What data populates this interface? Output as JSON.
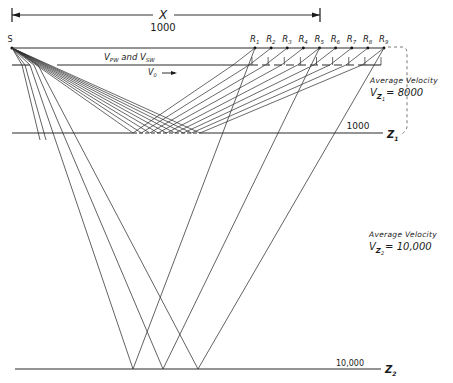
{
  "diagram": {
    "dimension": {
      "symbol": "X",
      "value": "1000"
    },
    "source_label": "S",
    "receivers": [
      "R1",
      "R2",
      "R3",
      "R4",
      "R5",
      "R6",
      "R7",
      "R8",
      "R9"
    ],
    "receiver_labels": [
      {
        "base": "R",
        "sub": "1"
      },
      {
        "base": "R",
        "sub": "2"
      },
      {
        "base": "R",
        "sub": "3"
      },
      {
        "base": "R",
        "sub": "4"
      },
      {
        "base": "R",
        "sub": "5"
      },
      {
        "base": "R",
        "sub": "6"
      },
      {
        "base": "R",
        "sub": "7"
      },
      {
        "base": "R",
        "sub": "8"
      },
      {
        "base": "R",
        "sub": "9"
      }
    ],
    "weathering_layer": {
      "label_v1": "V",
      "label_v1_sub": "PW",
      "label_and": "and",
      "label_v2": "V",
      "label_v2_sub": "SW",
      "velocity_label": "V",
      "velocity_sub": "0",
      "arrow": "→"
    },
    "layer1": {
      "depth": "1000",
      "name": "Z",
      "name_sub": "1",
      "velocity_title": "Average Velocity",
      "velocity_symbol": "V",
      "velocity_sub": "Z",
      "velocity_subsub": "1",
      "velocity_value": "= 8000"
    },
    "layer2": {
      "depth": "10,000",
      "name": "Z",
      "name_sub": "2",
      "velocity_title": "Average Velocity",
      "velocity_symbol": "V",
      "velocity_sub": "Z",
      "velocity_subsub": "2",
      "velocity_value": "= 10,000"
    },
    "deep_ray_receivers": [
      "R1",
      "R5",
      "R9"
    ],
    "colors": {
      "line": "#2a2a2a",
      "background": "#ffffff"
    }
  }
}
